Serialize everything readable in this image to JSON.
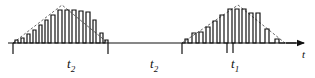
{
  "figure": {
    "axis": {
      "name": "time-axis",
      "label": "t",
      "baseline_y": 43,
      "x_start": 8,
      "x_end": 308,
      "arrow": "right-arrow"
    },
    "colors": {
      "stroke": "#111111",
      "envelope": "#555555",
      "background": "#ffffff"
    },
    "interval_labels": [
      {
        "name": "interval-label-t2-first",
        "base": "t",
        "sub": "2",
        "x": 67,
        "y": 68
      },
      {
        "name": "interval-label-t2-second",
        "base": "t",
        "sub": "2",
        "x": 150,
        "y": 68
      },
      {
        "name": "interval-label-t1",
        "base": "t",
        "sub": "1",
        "x": 231,
        "y": 68
      }
    ],
    "ticks": [
      {
        "name": "tick-burst1-start",
        "x": 13,
        "y0": 43,
        "y1": 54
      },
      {
        "name": "tick-burst1-end",
        "x": 108,
        "y0": 43,
        "y1": 54
      },
      {
        "name": "tick-burst2-start",
        "x": 182,
        "y0": 43,
        "y1": 54
      },
      {
        "name": "tick-t1-left",
        "x": 227,
        "y0": 43,
        "y1": 53
      },
      {
        "name": "tick-t1-right",
        "x": 233,
        "y0": 43,
        "y1": 53
      }
    ]
  },
  "chart_data": {
    "type": "line",
    "xlabel": "t",
    "ylabel": "",
    "grid": false,
    "legend": null,
    "baseline": 0,
    "xlim": [
      0,
      315
    ],
    "ylim": [
      0,
      40
    ],
    "bursts": [
      {
        "name": "burst-1",
        "envelope": "triangular",
        "envelope_peak_x": 62,
        "envelope_peak_height": 38,
        "envelope_start_x": 13,
        "envelope_end_x": 108,
        "pulses": [
          {
            "x": 15,
            "width": 3,
            "height": 3
          },
          {
            "x": 21,
            "width": 3,
            "height": 5
          },
          {
            "x": 27,
            "width": 3,
            "height": 9
          },
          {
            "x": 33,
            "width": 3,
            "height": 13
          },
          {
            "x": 39,
            "width": 3,
            "height": 18
          },
          {
            "x": 45,
            "width": 3,
            "height": 23
          },
          {
            "x": 51,
            "width": 4,
            "height": 28
          },
          {
            "x": 58,
            "width": 4,
            "height": 33
          },
          {
            "x": 65,
            "width": 4,
            "height": 33
          },
          {
            "x": 72,
            "width": 4,
            "height": 33
          },
          {
            "x": 79,
            "width": 4,
            "height": 32
          },
          {
            "x": 86,
            "width": 4,
            "height": 31
          },
          {
            "x": 93,
            "width": 3,
            "height": 23
          },
          {
            "x": 100,
            "width": 3,
            "height": 10
          },
          {
            "x": 105,
            "width": 3,
            "height": 3
          }
        ]
      },
      {
        "name": "burst-2",
        "envelope": "triangular",
        "envelope_peak_x": 238,
        "envelope_peak_height": 38,
        "envelope_start_x": 182,
        "envelope_end_x": 285,
        "pulses": [
          {
            "x": 185,
            "width": 3,
            "height": 4
          },
          {
            "x": 192,
            "width": 4,
            "height": 10
          },
          {
            "x": 199,
            "width": 4,
            "height": 11
          },
          {
            "x": 206,
            "width": 4,
            "height": 16
          },
          {
            "x": 213,
            "width": 4,
            "height": 22
          },
          {
            "x": 220,
            "width": 4,
            "height": 28
          },
          {
            "x": 228,
            "width": 4,
            "height": 34
          },
          {
            "x": 235,
            "width": 4,
            "height": 34
          },
          {
            "x": 242,
            "width": 4,
            "height": 34
          },
          {
            "x": 249,
            "width": 4,
            "height": 30
          },
          {
            "x": 256,
            "width": 4,
            "height": 30
          },
          {
            "x": 265,
            "width": 4,
            "height": 14
          },
          {
            "x": 275,
            "width": 4,
            "height": 4
          }
        ]
      }
    ],
    "gap": {
      "name": "gap-between-bursts",
      "x_start": 108,
      "x_end": 182,
      "height": 0
    }
  }
}
